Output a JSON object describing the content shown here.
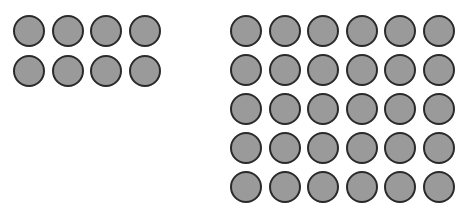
{
  "diagram": {
    "colors": {
      "fill": "#9a9a9a",
      "stroke": "#2a2a2a",
      "background": "#ffffff"
    },
    "groups": [
      {
        "name": "left-array",
        "rows": 2,
        "columns": 4,
        "count": 8
      },
      {
        "name": "right-array",
        "rows": 5,
        "columns": 6,
        "count": 30
      }
    ]
  }
}
